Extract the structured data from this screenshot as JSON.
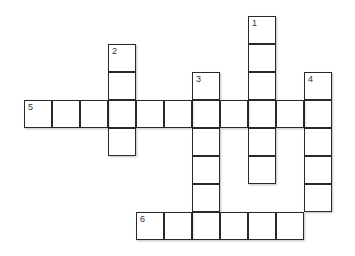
{
  "puzzle": {
    "type": "crossword",
    "rows": 9,
    "cols": 11,
    "clues": [
      {
        "number": "1",
        "direction": "down",
        "row": 0,
        "col": 8,
        "length": 6
      },
      {
        "number": "2",
        "direction": "down",
        "row": 1,
        "col": 3,
        "length": 4
      },
      {
        "number": "3",
        "direction": "down",
        "row": 2,
        "col": 6,
        "length": 6
      },
      {
        "number": "4",
        "direction": "down",
        "row": 2,
        "col": 10,
        "length": 5
      },
      {
        "number": "5",
        "direction": "across",
        "row": 3,
        "col": 0,
        "length": 11
      },
      {
        "number": "6",
        "direction": "across",
        "row": 7,
        "col": 4,
        "length": 6
      }
    ]
  }
}
